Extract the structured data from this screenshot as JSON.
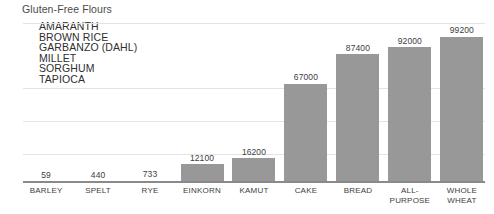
{
  "chart_data": {
    "type": "bar",
    "title": "Gluten-Free Flours",
    "xlabel": "",
    "ylabel": "",
    "ylim": [
      0,
      108000
    ],
    "grid": true,
    "legend_position": "none",
    "categories": [
      "BARLEY",
      "SPELT",
      "RYE",
      "EINKORN",
      "KAMUT",
      "CAKE",
      "BREAD",
      "ALL-PURPOSE",
      "WHOLE\nWHEAT"
    ],
    "values": [
      59,
      440,
      733,
      12100,
      16200,
      67000,
      87400,
      92000,
      99200
    ],
    "bars": [
      {
        "label": "BARLEY",
        "value": 59,
        "value_label": "59"
      },
      {
        "label": "SPELT",
        "value": 440,
        "value_label": "440"
      },
      {
        "label": "RYE",
        "value": 733,
        "value_label": "733"
      },
      {
        "label": "EINKORN",
        "value": 12100,
        "value_label": "12100"
      },
      {
        "label": "KAMUT",
        "value": 16200,
        "value_label": "16200"
      },
      {
        "label": "CAKE",
        "value": 67000,
        "value_label": "67000"
      },
      {
        "label": "BREAD",
        "value": 87400,
        "value_label": "87400"
      },
      {
        "label": "ALL-PURPOSE",
        "value": 92000,
        "value_label": "92000"
      },
      {
        "label": "WHOLE WHEAT",
        "value": 99200,
        "value_label": "99200"
      }
    ],
    "annotation_title": "Gluten-Free Flours",
    "annotations": [
      "AMARANTH",
      "BROWN RICE",
      "GARBANZO (DAHL)",
      "MILLET",
      "SORGHUM",
      "TAPIOCA"
    ],
    "bar_color": "#989898",
    "gridline_color": "#e4e4e4",
    "axis_color": "#8a8a8a"
  }
}
